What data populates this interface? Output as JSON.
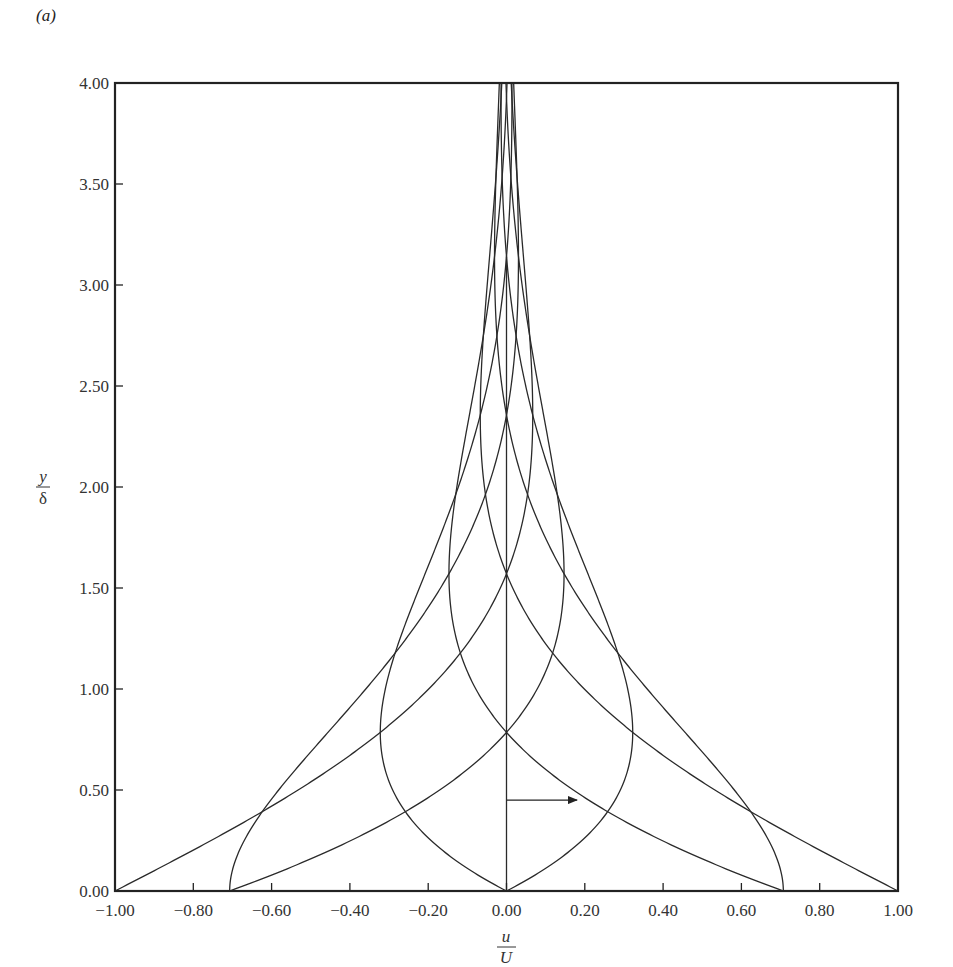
{
  "panel_label": "(a)",
  "chart_data": {
    "type": "line",
    "title": "",
    "panel": "(a)",
    "xlabel": "u/U",
    "xlabel_num": "u",
    "xlabel_den": "U",
    "ylabel": "y/δ",
    "ylabel_num": "y",
    "ylabel_den": "δ",
    "xlim": [
      -1.0,
      1.0
    ],
    "ylim": [
      0.0,
      4.0
    ],
    "grid": false,
    "legend": null,
    "xticks": [
      "-1.00",
      "-0.80",
      "-0.60",
      "-0.40",
      "-0.20",
      "0.00",
      "0.20",
      "0.40",
      "0.60",
      "0.80",
      "1.00"
    ],
    "xtick_values": [
      -1.0,
      -0.8,
      -0.6,
      -0.4,
      -0.2,
      0.0,
      0.2,
      0.4,
      0.6,
      0.8,
      1.0
    ],
    "yticks": [
      "0.00",
      "0.50",
      "1.00",
      "1.50",
      "2.00",
      "2.50",
      "3.00",
      "3.50",
      "4.00"
    ],
    "ytick_values": [
      0.0,
      0.5,
      1.0,
      1.5,
      2.0,
      2.5,
      3.0,
      3.5,
      4.0
    ],
    "series": [
      {
        "name": "phase 0",
        "phase_deg": 0,
        "u_at_wall": 1.0
      },
      {
        "name": "phase 45",
        "phase_deg": 45,
        "u_at_wall": 0.707
      },
      {
        "name": "phase 90",
        "phase_deg": 90,
        "u_at_wall": 0.0
      },
      {
        "name": "phase 135",
        "phase_deg": 135,
        "u_at_wall": -0.707
      },
      {
        "name": "phase 180",
        "phase_deg": 180,
        "u_at_wall": -1.0
      },
      {
        "name": "phase 225",
        "phase_deg": 225,
        "u_at_wall": -0.707
      },
      {
        "name": "phase 270",
        "phase_deg": 270,
        "u_at_wall": 0.0
      },
      {
        "name": "phase 315",
        "phase_deg": 315,
        "u_at_wall": 0.707
      }
    ],
    "sample_points": {
      "y": [
        0.0,
        0.5,
        1.0,
        1.5,
        2.0,
        2.5,
        3.0,
        3.5,
        4.0
      ],
      "phase_0": [
        1.0,
        0.532,
        0.199,
        0.016,
        -0.056,
        -0.066,
        -0.049,
        -0.028,
        -0.012
      ],
      "phase_90": [
        0.0,
        0.291,
        0.31,
        0.223,
        0.123,
        0.049,
        0.007,
        -0.011,
        -0.014
      ]
    },
    "annotations": [
      {
        "type": "arrow",
        "from": [
          0.0,
          0.45
        ],
        "to": [
          0.18,
          0.45
        ]
      },
      {
        "type": "vline",
        "x": 0.0,
        "y_from": 0.0,
        "y_to": 3.14
      }
    ]
  }
}
